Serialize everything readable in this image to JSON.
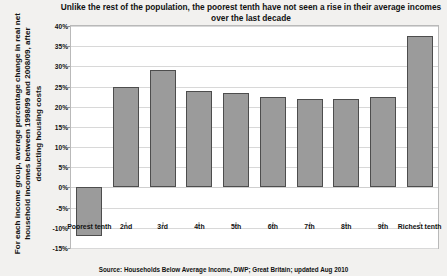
{
  "chart_data": {
    "type": "bar",
    "title": "Unlike the rest of the population, the poorest tenth have not seen a rise in their average incomes over the last decade",
    "title_line1": "Unlike the rest of the population, the poorest tenth have not seen a rise in their",
    "title_line2": "average incomes over the last decade",
    "ylabel": "For each income group, average percentage change in real net household incomes between 1998/99 and 2008/09, after deducting housing costs",
    "ylabel_line1": "For each income group, average percentage change in",
    "ylabel_line2": "real net household incomes between 1998/99 and",
    "ylabel_line3": "2008/09, after deducting housing costs",
    "xlabel": "",
    "categories": [
      "Poorest tenth",
      "2nd",
      "3rd",
      "4th",
      "5th",
      "6th",
      "7th",
      "8th",
      "9th",
      "Richest tenth"
    ],
    "values": [
      -12,
      25,
      29,
      24,
      23.5,
      22.5,
      22,
      22,
      22.5,
      37.5
    ],
    "ylim": [
      -15,
      40
    ],
    "ytick_labels": [
      "40%",
      "35%",
      "30%",
      "25%",
      "20%",
      "15%",
      "10%",
      "5%",
      "0%",
      "-5%",
      "-10%",
      "-15%"
    ],
    "ytick_values": [
      40,
      35,
      30,
      25,
      20,
      15,
      10,
      5,
      0,
      -5,
      -10,
      -15
    ],
    "grid": true,
    "legend": "none",
    "bar_color": "#9b9b9b",
    "bar_border_color": "#4d4d4d",
    "plot_background": "#ffffff",
    "figure_background": "#f2f1ef",
    "gridline_color": "#d8d8d8",
    "source": "Source: Households Below Average Income, DWP; Great Britain; updated Aug 2010"
  }
}
